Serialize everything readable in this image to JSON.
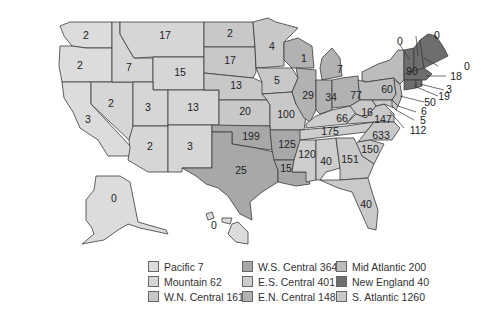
{
  "colors": {
    "pacific": "#dcdcdc",
    "mountain": "#d6d6d6",
    "wn_central": "#c8c8c8",
    "ws_central": "#a8a8a8",
    "es_central": "#cdcdcd",
    "en_central": "#b2b2b2",
    "mid_atlantic": "#bcbcbc",
    "new_england": "#6e6e6e",
    "s_atlantic": "#c9c9c9"
  },
  "states": {
    "WA": "2",
    "OR": "2",
    "CA": "3",
    "NV": "2",
    "ID": "7",
    "MT": "17",
    "WY": "15",
    "UT": "3",
    "CO": "13",
    "AZ": "2",
    "NM": "3",
    "ND": "2",
    "SD": "17",
    "NE": "13",
    "KS": "20",
    "MN": "4",
    "IA": "5",
    "MO": "100",
    "OK": "199",
    "TX": "25",
    "AR": "125",
    "LA": "15",
    "WI": "1",
    "MI": "7",
    "IL": "29",
    "IN": "34",
    "OH": "77",
    "KY": "66",
    "TN": "175",
    "MS": "120",
    "AL": "40",
    "NY": "90",
    "PA": "60",
    "NJ": "50",
    "VT": "0",
    "NH": "0",
    "ME": "0",
    "MA": "18",
    "RI": "3",
    "CT": "19",
    "WV": "16",
    "VA": "147",
    "NC": "633",
    "SC": "150",
    "GA": "151",
    "FL": "40",
    "DE": "6",
    "MD": "5",
    "DC": "112",
    "AK": "0",
    "HI": "0"
  },
  "legend": [
    {
      "label": "Pacific 7",
      "color": "#dcdcdc"
    },
    {
      "label": "W.S. Central 364",
      "color": "#a8a8a8"
    },
    {
      "label": "Mid Atlantic 200",
      "color": "#bcbcbc"
    },
    {
      "label": "Mountain 62",
      "color": "#d6d6d6"
    },
    {
      "label": "E.S. Central 401",
      "color": "#cdcdcd"
    },
    {
      "label": "New England 40",
      "color": "#6e6e6e"
    },
    {
      "label": "W.N. Central 161",
      "color": "#c8c8c8"
    },
    {
      "label": "E.N. Central 148",
      "color": "#b2b2b2"
    },
    {
      "label": "S. Atlantic 1260",
      "color": "#c9c9c9"
    }
  ]
}
